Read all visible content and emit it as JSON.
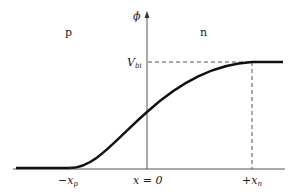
{
  "diagram": {
    "y_axis_label": "ϕ",
    "regions": {
      "left": "p",
      "right": "n"
    },
    "level_label": {
      "main": "V",
      "sub": "bi"
    },
    "x_ticks": [
      {
        "main": "−x",
        "sub": "p"
      },
      {
        "main": "x = 0",
        "sub": ""
      },
      {
        "main": "+x",
        "sub": "n"
      }
    ],
    "colors": {
      "curve": "#111111",
      "axes": "#555555",
      "dashed": "#555555",
      "text": "#222222"
    }
  }
}
